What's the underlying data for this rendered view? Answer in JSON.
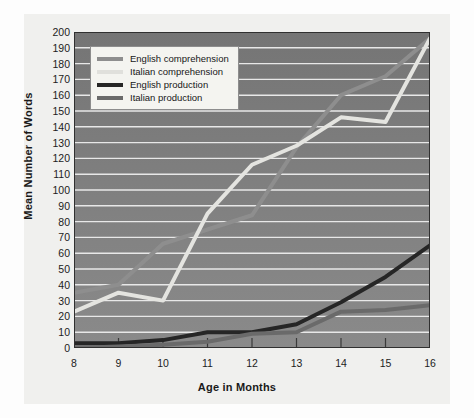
{
  "chart_data": {
    "type": "line",
    "title": "",
    "xlabel": "Age in Months",
    "ylabel": "Mean Number of Words",
    "x": [
      8,
      9,
      10,
      11,
      12,
      13,
      14,
      15,
      16
    ],
    "xlim": [
      8,
      16
    ],
    "ylim": [
      0,
      200
    ],
    "ytick_step": 10,
    "xtick_labels": [
      "8",
      "9",
      "10",
      "11",
      "12",
      "13",
      "14",
      "15",
      "16"
    ],
    "ytick_labels": [
      "0",
      "10",
      "20",
      "30",
      "40",
      "50",
      "60",
      "70",
      "80",
      "90",
      "100",
      "110",
      "120",
      "130",
      "140",
      "150",
      "160",
      "170",
      "180",
      "190",
      "200"
    ],
    "grid": "horizontal",
    "legend_position": "top-left",
    "plot_background": "#7c7c7c",
    "gridline_color": "#e8e8e8",
    "series": [
      {
        "name": "English comprehension",
        "color": "#8e8e8e",
        "width": 4,
        "values": [
          35,
          40,
          66,
          75,
          84,
          127,
          160,
          172,
          196
        ]
      },
      {
        "name": "Italian comprehension",
        "color": "#e4e4e0",
        "width": 4,
        "values": [
          23,
          35,
          30,
          85,
          116,
          128,
          146,
          143,
          196
        ]
      },
      {
        "name": "English production",
        "color": "#262626",
        "width": 4,
        "values": [
          3,
          3,
          5,
          10,
          10,
          15,
          29,
          45,
          65
        ]
      },
      {
        "name": "Italian production",
        "color": "#6a6a6a",
        "width": 4,
        "values": [
          0,
          1,
          2,
          4,
          9,
          10,
          23,
          24,
          27
        ]
      }
    ]
  },
  "legend": {
    "items": [
      {
        "label": "English comprehension",
        "color": "#8e8e8e"
      },
      {
        "label": "Italian comprehension",
        "color": "#e0e0dc"
      },
      {
        "label": "English production",
        "color": "#262626"
      },
      {
        "label": "Italian production",
        "color": "#6a6a6a"
      }
    ]
  },
  "axes": {
    "x_title": "Age in Months",
    "y_title": "Mean Number of Words"
  }
}
